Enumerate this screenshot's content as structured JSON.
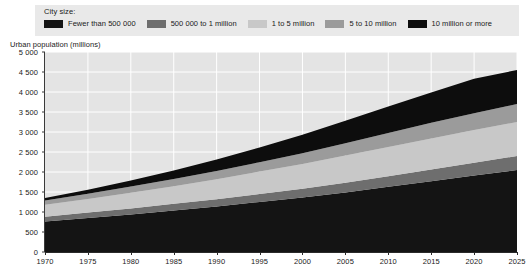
{
  "legend": {
    "title": "City size:",
    "items": [
      {
        "label": "Fewer than 500 000",
        "color": "#141414"
      },
      {
        "label": "500 000 to 1 million",
        "color": "#6e6e6e"
      },
      {
        "label": "1 to 5 million",
        "color": "#c8c8c8"
      },
      {
        "label": "5 to 10 million",
        "color": "#9b9b9b"
      },
      {
        "label": "10 million or more",
        "color": "#0d0d0d"
      }
    ]
  },
  "axis_title": "Urban population (millions)",
  "chart_data": {
    "type": "area",
    "title": "Urban population (millions)",
    "xlabel": "",
    "ylabel": "Urban population (millions)",
    "stacked": true,
    "grid": true,
    "legend_position": "top",
    "plot_background": "#e4e4e4",
    "gridline_color": "#ffffff",
    "xlim": [
      1970,
      2025
    ],
    "ylim": [
      0,
      5000
    ],
    "ytick_labels": [
      "5 000",
      "4 500",
      "4 000",
      "3 500",
      "3 000",
      "2 500",
      "2 000",
      "1 500",
      "1 000",
      "500",
      "0"
    ],
    "yticks": [
      5000,
      4500,
      4000,
      3500,
      3000,
      2500,
      2000,
      1500,
      1000,
      500,
      0
    ],
    "xtick_labels": [
      "1970",
      "1975",
      "1980",
      "1985",
      "1990",
      "1995",
      "2000",
      "2005",
      "2010",
      "2015",
      "2020",
      "2025"
    ],
    "x": [
      1970,
      1975,
      1980,
      1985,
      1990,
      1995,
      2000,
      2005,
      2010,
      2015,
      2020,
      2025
    ],
    "series": [
      {
        "name": "Fewer than 500 000",
        "color": "#141414",
        "values": [
          760,
          850,
          940,
          1040,
          1140,
          1250,
          1360,
          1490,
          1630,
          1770,
          1910,
          2050
        ]
      },
      {
        "name": "500 000 to 1 million",
        "color": "#6e6e6e",
        "values": [
          120,
          135,
          150,
          165,
          180,
          200,
          220,
          240,
          265,
          290,
          320,
          350
        ]
      },
      {
        "name": "1 to 5 million",
        "color": "#c8c8c8",
        "values": [
          300,
          340,
          390,
          440,
          500,
          560,
          620,
          680,
          730,
          780,
          820,
          850
        ]
      },
      {
        "name": "5 to 10 million",
        "color": "#9b9b9b",
        "values": [
          110,
          130,
          155,
          180,
          205,
          235,
          270,
          310,
          350,
          390,
          420,
          450
        ]
      },
      {
        "name": "10 million or more",
        "color": "#0d0d0d",
        "values": [
          60,
          100,
          150,
          215,
          290,
          370,
          460,
          560,
          660,
          760,
          860,
          850
        ]
      }
    ],
    "totals": [
      1350,
      1555,
      1785,
      2040,
      2315,
      2615,
      2930,
      3280,
      3635,
      3990,
      4330,
      4550
    ]
  }
}
